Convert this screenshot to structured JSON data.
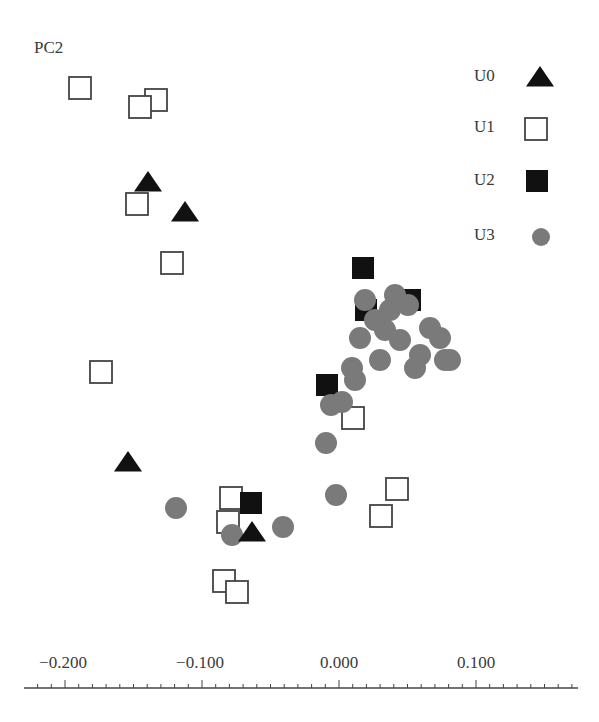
{
  "chart_data": {
    "type": "scatter",
    "title": "",
    "xlabel": "",
    "ylabel": "PC2",
    "xlim": [
      -0.22,
      0.17
    ],
    "x_ticks": [
      -0.2,
      -0.1,
      0.0,
      0.1
    ],
    "x_tick_labels": [
      "−0.200",
      "−0.100",
      "0.000",
      "0.100"
    ],
    "minor_tick_step": 0.01,
    "grid": false,
    "legend_position": "upper right",
    "note": "y values estimated from pixel positions using the x-axis scale; no y tick labels are shown",
    "series": [
      {
        "name": "U0",
        "marker": "triangle-filled",
        "color": "#111111",
        "points": [
          [
            -0.14,
            0.159
          ],
          [
            -0.112,
            0.137
          ],
          [
            -0.154,
            -0.045
          ],
          [
            -0.063,
            -0.096
          ]
        ]
      },
      {
        "name": "U1",
        "marker": "square-open",
        "color": "#444444",
        "points": [
          [
            -0.189,
            0.228
          ],
          [
            -0.133,
            0.219
          ],
          [
            -0.145,
            0.214
          ],
          [
            -0.147,
            0.143
          ],
          [
            -0.122,
            0.1
          ],
          [
            -0.174,
            0.02
          ],
          [
            0.01,
            -0.013
          ],
          [
            0.042,
            -0.065
          ],
          [
            0.031,
            -0.085
          ],
          [
            -0.079,
            -0.072
          ],
          [
            -0.081,
            -0.089
          ],
          [
            -0.084,
            -0.132
          ],
          [
            -0.074,
            -0.14
          ]
        ]
      },
      {
        "name": "U2",
        "marker": "square-filled",
        "color": "#111111",
        "points": [
          [
            0.018,
            0.096
          ],
          [
            0.052,
            0.073
          ],
          [
            0.02,
            0.066
          ],
          [
            -0.009,
            0.011
          ],
          [
            -0.064,
            -0.075
          ]
        ]
      },
      {
        "name": "U3",
        "marker": "circle",
        "color": "#777777",
        "points": [
          [
            -0.119,
            -0.079
          ],
          [
            -0.041,
            -0.093
          ],
          [
            -0.078,
            -0.099
          ],
          [
            -0.002,
            -0.069
          ],
          [
            -0.009,
            -0.031
          ],
          [
            -0.006,
            -0.004
          ],
          [
            0.002,
            -0.001
          ],
          [
            0.019,
            0.073
          ],
          [
            0.041,
            0.077
          ],
          [
            0.05,
            0.069
          ],
          [
            0.034,
            0.051
          ],
          [
            0.044,
            0.044
          ],
          [
            0.015,
            0.045
          ],
          [
            0.066,
            0.053
          ],
          [
            0.074,
            0.045
          ],
          [
            0.077,
            0.029
          ],
          [
            0.055,
            0.023
          ],
          [
            0.009,
            0.023
          ],
          [
            0.012,
            0.015
          ],
          [
            0.03,
            0.029
          ],
          [
            0.059,
            0.033
          ],
          [
            0.08,
            0.029
          ],
          [
            0.037,
            0.066
          ],
          [
            0.026,
            0.058
          ]
        ]
      }
    ],
    "pixel_points": {
      "U0": [
        [
          148,
          183
        ],
        [
          185,
          213
        ],
        [
          128,
          463
        ],
        [
          252,
          533
        ]
      ],
      "U1": [
        [
          80,
          88
        ],
        [
          156,
          100
        ],
        [
          140,
          107
        ],
        [
          137,
          204
        ],
        [
          172,
          263
        ],
        [
          101,
          372
        ],
        [
          353,
          418
        ],
        [
          397,
          489
        ],
        [
          381,
          516
        ],
        [
          231,
          498
        ],
        [
          228,
          522
        ],
        [
          224,
          581
        ],
        [
          237,
          592
        ]
      ],
      "U2": [
        [
          363,
          268
        ],
        [
          410,
          300
        ],
        [
          366,
          310
        ],
        [
          327,
          385
        ],
        [
          251,
          503
        ]
      ],
      "U3": [
        [
          176,
          508
        ],
        [
          283,
          527
        ],
        [
          232,
          535
        ],
        [
          336,
          495
        ],
        [
          326,
          443
        ],
        [
          331,
          405
        ],
        [
          342,
          402
        ],
        [
          365,
          300
        ],
        [
          395,
          295
        ],
        [
          408,
          305
        ],
        [
          385,
          330
        ],
        [
          400,
          340
        ],
        [
          360,
          338
        ],
        [
          430,
          328
        ],
        [
          440,
          338
        ],
        [
          445,
          360
        ],
        [
          415,
          368
        ],
        [
          352,
          368
        ],
        [
          355,
          380
        ],
        [
          380,
          360
        ],
        [
          420,
          355
        ],
        [
          450,
          360
        ],
        [
          390,
          310
        ],
        [
          375,
          320
        ]
      ]
    }
  },
  "axis": {
    "ylabel": "PC2",
    "tick_labels": [
      "−0.200",
      "−0.100",
      "0.000",
      "0.100"
    ]
  },
  "legend": {
    "items": [
      {
        "label": "U0",
        "marker": "triangle-filled"
      },
      {
        "label": "U1",
        "marker": "square-open"
      },
      {
        "label": "U2",
        "marker": "square-filled"
      },
      {
        "label": "U3",
        "marker": "circle"
      }
    ]
  },
  "colors": {
    "triangle": "#111111",
    "filled_square": "#111111",
    "open_square_stroke": "#444444",
    "circle": "#7a7a7a",
    "axis": "#444444"
  }
}
